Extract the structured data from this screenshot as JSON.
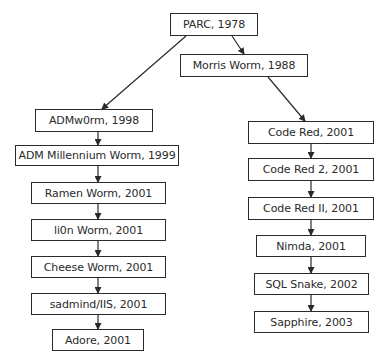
{
  "diagram": {
    "type": "tree",
    "nodes": [
      {
        "id": "parc",
        "label": "PARC, 1978",
        "x": 170,
        "y": 13,
        "w": 88,
        "h": 23
      },
      {
        "id": "morris",
        "label": "Morris Worm, 1988",
        "x": 180,
        "y": 54,
        "w": 128,
        "h": 23
      },
      {
        "id": "admw0rm",
        "label": "ADMw0rm, 1998",
        "x": 35,
        "y": 109,
        "w": 118,
        "h": 23
      },
      {
        "id": "admmill",
        "label": "ADM Millennium Worm, 1999",
        "x": 15,
        "y": 145,
        "w": 164,
        "h": 21
      },
      {
        "id": "ramen",
        "label": "Ramen Worm, 2001",
        "x": 31,
        "y": 182,
        "w": 135,
        "h": 22
      },
      {
        "id": "lion",
        "label": "li0n Worm, 2001",
        "x": 31,
        "y": 219,
        "w": 135,
        "h": 22
      },
      {
        "id": "cheese",
        "label": "Cheese Worm, 2001",
        "x": 31,
        "y": 256,
        "w": 135,
        "h": 22
      },
      {
        "id": "sadmind",
        "label": "sadmind/IIS, 2001",
        "x": 31,
        "y": 293,
        "w": 135,
        "h": 22
      },
      {
        "id": "adore",
        "label": "Adore, 2001",
        "x": 52,
        "y": 329,
        "w": 92,
        "h": 22
      },
      {
        "id": "codered",
        "label": "Code Red, 2001",
        "x": 248,
        "y": 121,
        "w": 126,
        "h": 23
      },
      {
        "id": "codered2",
        "label": "Code Red 2, 2001",
        "x": 248,
        "y": 158,
        "w": 126,
        "h": 23
      },
      {
        "id": "coderedii",
        "label": "Code Red II, 2001",
        "x": 248,
        "y": 197,
        "w": 126,
        "h": 23
      },
      {
        "id": "nimda",
        "label": "Nimda, 2001",
        "x": 256,
        "y": 235,
        "w": 110,
        "h": 22
      },
      {
        "id": "sqlsnake",
        "label": "SQL Snake, 2002",
        "x": 254,
        "y": 273,
        "w": 115,
        "h": 22
      },
      {
        "id": "sapphire",
        "label": "Sapphire, 2003",
        "x": 254,
        "y": 311,
        "w": 115,
        "h": 22
      }
    ],
    "edges": [
      {
        "from": "parc",
        "to": "admw0rm",
        "x1": 186,
        "y1": 36,
        "x2": 102,
        "y2": 109
      },
      {
        "from": "parc",
        "to": "morris",
        "x1": 232,
        "y1": 36,
        "x2": 244,
        "y2": 54
      },
      {
        "from": "morris",
        "to": "codered",
        "x1": 268,
        "y1": 77,
        "x2": 305,
        "y2": 121
      },
      {
        "from": "admw0rm",
        "to": "admmill",
        "x1": 98,
        "y1": 132,
        "x2": 98,
        "y2": 145
      },
      {
        "from": "admmill",
        "to": "ramen",
        "x1": 98,
        "y1": 166,
        "x2": 98,
        "y2": 182
      },
      {
        "from": "ramen",
        "to": "lion",
        "x1": 98,
        "y1": 204,
        "x2": 98,
        "y2": 219
      },
      {
        "from": "lion",
        "to": "cheese",
        "x1": 98,
        "y1": 241,
        "x2": 98,
        "y2": 256
      },
      {
        "from": "cheese",
        "to": "sadmind",
        "x1": 98,
        "y1": 278,
        "x2": 98,
        "y2": 293
      },
      {
        "from": "sadmind",
        "to": "adore",
        "x1": 98,
        "y1": 315,
        "x2": 98,
        "y2": 329
      },
      {
        "from": "codered",
        "to": "codered2",
        "x1": 311,
        "y1": 144,
        "x2": 311,
        "y2": 158
      },
      {
        "from": "codered2",
        "to": "coderedii",
        "x1": 311,
        "y1": 181,
        "x2": 311,
        "y2": 197
      },
      {
        "from": "coderedii",
        "to": "nimda",
        "x1": 311,
        "y1": 220,
        "x2": 311,
        "y2": 235
      },
      {
        "from": "nimda",
        "to": "sqlsnake",
        "x1": 311,
        "y1": 257,
        "x2": 311,
        "y2": 273
      },
      {
        "from": "sqlsnake",
        "to": "sapphire",
        "x1": 311,
        "y1": 295,
        "x2": 311,
        "y2": 311
      }
    ],
    "colors": {
      "stroke": "#2a2a2a",
      "text": "#2a2a2a",
      "background": "#ffffff"
    }
  }
}
